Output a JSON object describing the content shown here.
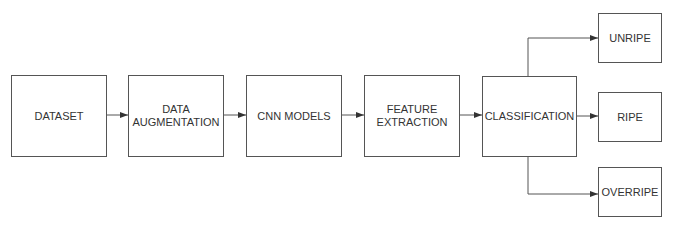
{
  "diagram": {
    "nodes": [
      {
        "id": "dataset",
        "label": "DATASET"
      },
      {
        "id": "augmentation",
        "label": "DATA AUGMENTATION"
      },
      {
        "id": "cnn",
        "label": "CNN MODELS"
      },
      {
        "id": "features",
        "label": "FEATURE EXTRACTION"
      },
      {
        "id": "classification",
        "label": "CLASSIFICATION"
      },
      {
        "id": "unripe",
        "label": "UNRIPE"
      },
      {
        "id": "ripe",
        "label": "RIPE"
      },
      {
        "id": "overripe",
        "label": "OVERRIPE"
      }
    ],
    "edges": [
      [
        "dataset",
        "augmentation"
      ],
      [
        "augmentation",
        "cnn"
      ],
      [
        "cnn",
        "features"
      ],
      [
        "features",
        "classification"
      ],
      [
        "classification",
        "unripe"
      ],
      [
        "classification",
        "ripe"
      ],
      [
        "classification",
        "overripe"
      ]
    ],
    "colors": {
      "stroke": "#555555",
      "text": "#333333",
      "background": "#ffffff"
    }
  }
}
